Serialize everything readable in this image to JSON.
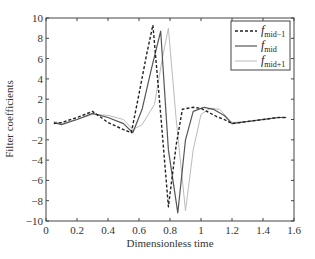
{
  "chart_data": {
    "type": "line",
    "title": "",
    "xlabel": "Dimensionless time",
    "ylabel": "Filter coefficients",
    "xlim": [
      0,
      1.6
    ],
    "ylim": [
      -10,
      10
    ],
    "xticks": [
      0,
      0.2,
      0.4,
      0.6,
      0.8,
      1,
      1.2,
      1.4,
      1.6
    ],
    "xtick_labels": [
      "0",
      "0.2",
      "0.4",
      "0.6",
      "0.8",
      "1",
      "1.2",
      "1.4",
      "1.6"
    ],
    "yticks": [
      -10,
      -8,
      -6,
      -4,
      -2,
      0,
      2,
      4,
      6,
      8,
      10
    ],
    "ytick_labels": [
      "−10",
      "−8",
      "−6",
      "−4",
      "−2",
      "0",
      "2",
      "4",
      "6",
      "8",
      "10"
    ],
    "grid": false,
    "legend_position": "upper right",
    "series": [
      {
        "name": "f_mid−1",
        "label_main": "f",
        "label_sub": "mid−1",
        "style": "dashed",
        "color": "#222222",
        "x": [
          0.05,
          0.1,
          0.2,
          0.3,
          0.4,
          0.5,
          0.55,
          0.6,
          0.65,
          0.69,
          0.74,
          0.79,
          0.84,
          0.88,
          0.95,
          1.0,
          1.05,
          1.1,
          1.15,
          1.2,
          1.3,
          1.4,
          1.5,
          1.55
        ],
        "y": [
          -0.4,
          -0.3,
          0.2,
          0.8,
          -0.3,
          -1.0,
          -1.3,
          2.5,
          6.5,
          9.3,
          0.5,
          -8.6,
          -2.5,
          1.0,
          1.2,
          1.1,
          0.7,
          0.3,
          0.0,
          -0.4,
          -0.2,
          0.0,
          0.2,
          0.2
        ]
      },
      {
        "name": "f_mid",
        "label_main": "f",
        "label_sub": "mid",
        "style": "solid",
        "color": "#555555",
        "x": [
          0.05,
          0.1,
          0.2,
          0.3,
          0.4,
          0.5,
          0.56,
          0.62,
          0.68,
          0.74,
          0.79,
          0.85,
          0.9,
          0.95,
          1.02,
          1.08,
          1.15,
          1.2,
          1.3,
          1.4,
          1.5,
          1.55
        ],
        "y": [
          -0.3,
          -0.5,
          0.0,
          0.6,
          0.2,
          -0.4,
          -1.3,
          1.0,
          5.0,
          8.7,
          -3.0,
          -9.2,
          -2.0,
          0.8,
          1.2,
          1.0,
          0.4,
          -0.4,
          -0.2,
          0.0,
          0.2,
          0.2
        ]
      },
      {
        "name": "f_mid+1",
        "label_main": "f",
        "label_sub": "mid+1",
        "style": "dotted-light",
        "color": "#bbbbbb",
        "x": [
          0.05,
          0.1,
          0.2,
          0.3,
          0.4,
          0.5,
          0.56,
          0.62,
          0.7,
          0.75,
          0.79,
          0.84,
          0.9,
          0.95,
          1.0,
          1.06,
          1.12,
          1.2,
          1.3,
          1.4,
          1.5,
          1.55
        ],
        "y": [
          -0.2,
          -0.4,
          0.0,
          0.5,
          0.4,
          0.0,
          -1.0,
          -0.5,
          1.5,
          6.0,
          9.0,
          0.0,
          -9.0,
          -3.0,
          0.5,
          1.1,
          1.0,
          -0.3,
          -0.2,
          0.0,
          0.2,
          0.2
        ]
      }
    ]
  },
  "legend": {
    "items": [
      {
        "main": "f",
        "sub": "mid−1"
      },
      {
        "main": "f",
        "sub": "mid"
      },
      {
        "main": "f",
        "sub": "mid+1"
      }
    ]
  }
}
